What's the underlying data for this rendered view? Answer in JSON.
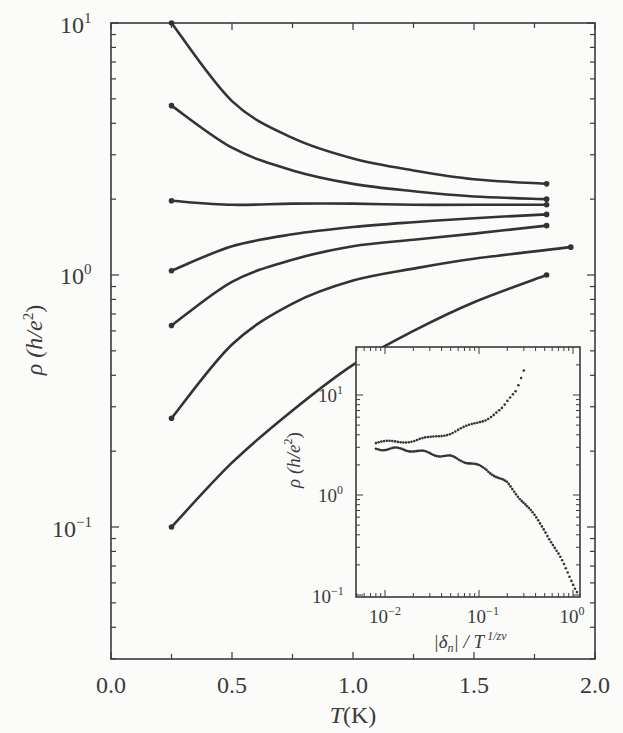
{
  "chart_data": [
    {
      "type": "line",
      "title": "",
      "xlabel": "T(K)",
      "ylabel": "ρ (h/e²)",
      "xscale": "linear",
      "yscale": "log",
      "xlim": [
        0.0,
        2.0
      ],
      "ylim": [
        0.03,
        10
      ],
      "xticks": [
        "0.0",
        "0.5",
        "1.0",
        "1.5",
        "2.0"
      ],
      "yticks": [
        "10^-1",
        "10^0",
        "10^1"
      ],
      "grid": false,
      "legend": null,
      "series": [
        {
          "name": "curve-1",
          "x": [
            0.25,
            0.5,
            0.75,
            1.0,
            1.25,
            1.5,
            1.8
          ],
          "y": [
            10.0,
            4.9,
            3.5,
            2.9,
            2.6,
            2.4,
            2.3
          ]
        },
        {
          "name": "curve-2",
          "x": [
            0.25,
            0.5,
            0.75,
            1.0,
            1.25,
            1.5,
            1.8
          ],
          "y": [
            4.7,
            3.2,
            2.6,
            2.3,
            2.15,
            2.05,
            2.0
          ]
        },
        {
          "name": "curve-3",
          "x": [
            0.25,
            0.5,
            0.75,
            1.0,
            1.25,
            1.5,
            1.8
          ],
          "y": [
            1.97,
            1.9,
            1.92,
            1.92,
            1.9,
            1.9,
            1.9
          ]
        },
        {
          "name": "curve-4",
          "x": [
            0.25,
            0.5,
            0.75,
            1.0,
            1.25,
            1.5,
            1.8
          ],
          "y": [
            1.04,
            1.3,
            1.45,
            1.55,
            1.62,
            1.68,
            1.74
          ]
        },
        {
          "name": "curve-5",
          "x": [
            0.25,
            0.5,
            0.75,
            1.0,
            1.25,
            1.5,
            1.8
          ],
          "y": [
            0.63,
            0.94,
            1.15,
            1.3,
            1.38,
            1.46,
            1.57
          ]
        },
        {
          "name": "curve-6",
          "x": [
            0.25,
            0.5,
            0.75,
            1.0,
            1.25,
            1.5,
            1.9
          ],
          "y": [
            0.27,
            0.53,
            0.77,
            0.95,
            1.06,
            1.16,
            1.29
          ]
        },
        {
          "name": "curve-7",
          "x": [
            0.25,
            0.5,
            0.75,
            1.0,
            1.25,
            1.5,
            1.8
          ],
          "y": [
            0.1,
            0.18,
            0.29,
            0.44,
            0.6,
            0.78,
            1.0
          ]
        }
      ]
    },
    {
      "type": "scatter",
      "title": "inset",
      "xlabel": "|δn| / T^(1/zν)",
      "ylabel": "ρ (h/e²)",
      "xscale": "log",
      "yscale": "log",
      "xlim": [
        0.005,
        1.2
      ],
      "ylim": [
        0.1,
        30
      ],
      "xticks": [
        "10^-2",
        "10^-1",
        "10^0"
      ],
      "yticks": [
        "10^-1",
        "10^0",
        "10^1"
      ],
      "series": [
        {
          "name": "insulating-branch",
          "x": [
            0.008,
            0.012,
            0.02,
            0.03,
            0.05,
            0.08,
            0.12,
            0.18,
            0.25,
            0.3
          ],
          "y": [
            3.3,
            3.4,
            3.5,
            3.7,
            4.2,
            4.9,
            5.8,
            7.4,
            11,
            18
          ]
        },
        {
          "name": "metallic-branch",
          "x": [
            0.008,
            0.012,
            0.02,
            0.03,
            0.05,
            0.08,
            0.12,
            0.2,
            0.3,
            0.5,
            0.8,
            1.1
          ],
          "y": [
            2.9,
            2.9,
            2.8,
            2.6,
            2.4,
            2.1,
            1.8,
            1.3,
            0.85,
            0.45,
            0.2,
            0.11
          ]
        }
      ]
    }
  ],
  "labels": {
    "main_xlabel_T": "T",
    "main_xlabel_unit": "(K)",
    "main_ylabel_rho": "ρ",
    "main_ylabel_unit": " (h/e",
    "main_ylabel_sup": "2",
    "main_ylabel_close": ")",
    "main_xticks": [
      "0.0",
      "0.5",
      "1.0",
      "1.5",
      "2.0"
    ],
    "main_ytick_base": "10",
    "main_ytick_exps": [
      "1",
      "0",
      "−1"
    ],
    "inset_ytick_exps": [
      "1",
      "0",
      "−1"
    ],
    "inset_xtick_exps": [
      "−2",
      "−1",
      "0"
    ],
    "inset_xlabel_pre": "|δ",
    "inset_xlabel_sub": "n",
    "inset_xlabel_mid": "| / T",
    "inset_xlabel_sup": " 1/zν"
  }
}
